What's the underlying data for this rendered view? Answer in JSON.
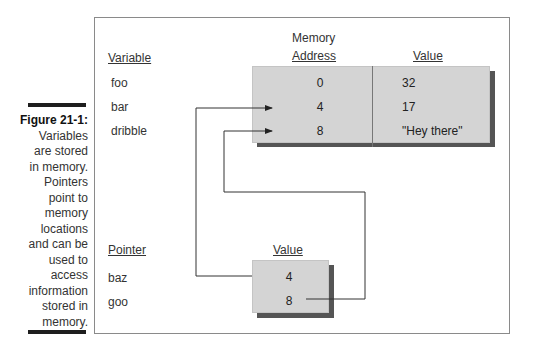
{
  "caption": {
    "figure_label": "Figure 21-1:",
    "text_lines": [
      "Variables",
      "are stored",
      "in memory.",
      "Pointers",
      "point to",
      "memory",
      "locations",
      "and can be",
      "used to",
      "access",
      "information",
      "stored in",
      "memory."
    ]
  },
  "memory_table": {
    "header_memory": "Memory",
    "header_address": "Address",
    "header_value": "Value",
    "variable_header": "Variable",
    "rows": [
      {
        "variable": "foo",
        "address": "0",
        "value": "32"
      },
      {
        "variable": "bar",
        "address": "4",
        "value": "17"
      },
      {
        "variable": "dribble",
        "address": "8",
        "value": "\"Hey there\""
      }
    ]
  },
  "pointer_table": {
    "pointer_header": "Pointer",
    "value_header": "Value",
    "rows": [
      {
        "pointer": "baz",
        "value": "4"
      },
      {
        "pointer": "goo",
        "value": "8"
      }
    ]
  },
  "colors": {
    "box_fill": "#d4d4d4",
    "shadow": "#555555",
    "frame": "#8a8a8a"
  }
}
